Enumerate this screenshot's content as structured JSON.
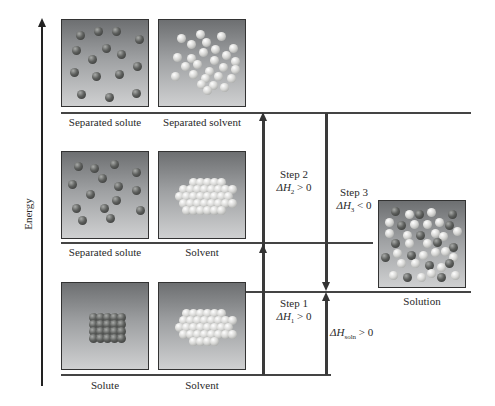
{
  "axis": {
    "label": "Energy"
  },
  "levels": {
    "top": {
      "labels": [
        "Separated solute",
        "Separated solvent"
      ]
    },
    "middle": {
      "labels": [
        "Separated solute",
        "Solvent"
      ]
    },
    "bottom": {
      "labels": [
        "Solute",
        "Solvent"
      ]
    },
    "solution": {
      "label": "Solution"
    }
  },
  "steps": {
    "step1": {
      "title": "Step 1",
      "dh": "ΔH",
      "sub": "1",
      "cond": "> 0"
    },
    "step2": {
      "title": "Step 2",
      "dh": "ΔH",
      "sub": "2",
      "cond": "> 0"
    },
    "step3": {
      "title": "Step 3",
      "dh": "ΔH",
      "sub": "3",
      "cond": "< 0"
    },
    "soln": {
      "dh": "ΔH",
      "sub": "soln",
      "cond": "> 0"
    }
  },
  "colors": {
    "line": "#3a3a3a",
    "box_top": "#6d6f71",
    "box_bottom": "#cfd0d1"
  }
}
